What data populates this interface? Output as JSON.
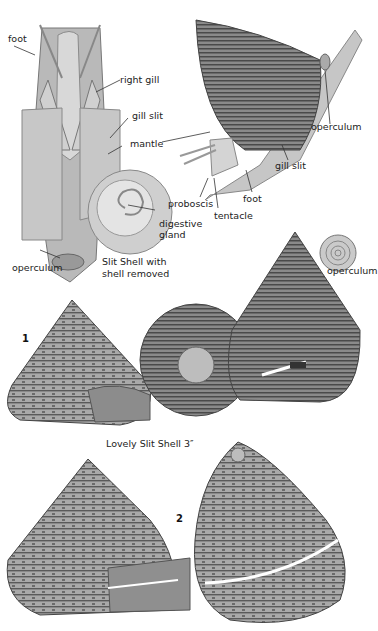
{
  "plate": {
    "anatomy_dissected": {
      "labels": {
        "foot": "foot",
        "right_gill": "right gill",
        "gill_slit": "gill slit",
        "mantle": "mantle",
        "digestive_gland_1": "digestive",
        "digestive_gland_2": "gland",
        "operculum": "operculum"
      },
      "caption_line1": "Slit Shell with",
      "caption_line2": "shell removed"
    },
    "anatomy_live": {
      "labels": {
        "operculum": "operculum",
        "gill_slit": "gill slit",
        "proboscis": "proboscis",
        "tentacle": "tentacle",
        "foot": "foot"
      }
    },
    "operculum_detail": {
      "label": "operculum"
    },
    "species_1": {
      "number": "1",
      "caption": "Lovely Slit Shell 3″"
    },
    "species_2": {
      "number": "2"
    }
  }
}
